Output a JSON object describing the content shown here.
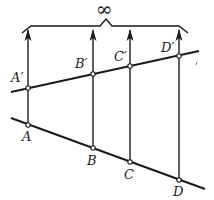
{
  "diagram": {
    "top_label": "∞",
    "colors": {
      "ink": "#1a1a1a",
      "background": "#ffffff"
    },
    "upper_line": {
      "from": [
        11,
        92
      ],
      "to": [
        199,
        51
      ]
    },
    "lower_line": {
      "from": [
        11,
        118
      ],
      "to": [
        205,
        189
      ]
    },
    "brace": {
      "left": [
        22,
        33
      ],
      "right": [
        188,
        33
      ],
      "top_y": 26,
      "peak": [
        106,
        19
      ]
    },
    "points": [
      {
        "name": "A",
        "upper_label": "A′",
        "x": 28,
        "upper_y": 88,
        "lower_y": 125,
        "upper_label_pos": [
          11,
          82
        ],
        "lower_label_pos": [
          22,
          141
        ]
      },
      {
        "name": "B",
        "upper_label": "B′",
        "x": 93,
        "upper_y": 74,
        "lower_y": 148,
        "upper_label_pos": [
          75,
          68
        ],
        "lower_label_pos": [
          87,
          165
        ]
      },
      {
        "name": "C",
        "upper_label": "C′",
        "x": 130,
        "upper_y": 66,
        "lower_y": 162,
        "upper_label_pos": [
          114,
          61
        ],
        "lower_label_pos": [
          124,
          179
        ]
      },
      {
        "name": "D",
        "upper_label": "D′",
        "x": 179,
        "upper_y": 56,
        "lower_y": 180,
        "upper_label_pos": [
          161,
          52
        ],
        "lower_label_pos": [
          173,
          196
        ]
      }
    ]
  }
}
